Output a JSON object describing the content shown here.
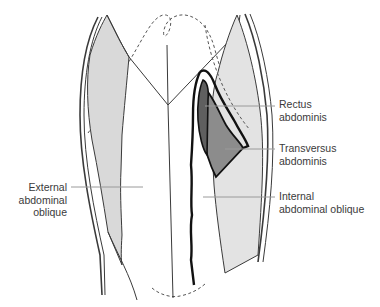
{
  "figure": {
    "type": "anatomical-diagram",
    "colors": {
      "background": "#ffffff",
      "outline": "#3a3a3a",
      "outline_bold": "#111111",
      "external_oblique_fill": "#d9d9d9",
      "internal_oblique_fill": "#e6e6e6",
      "rectus_fill": "#5f5f5f",
      "transversus_fill": "#8c8c8c",
      "leader_line": "#9a9a9a",
      "dashed_outline": "#555555"
    }
  },
  "labels": {
    "rectus": {
      "line1": "Rectus",
      "line2": "abdominis"
    },
    "transversus": {
      "line1": "Transversus",
      "line2": "abdominis"
    },
    "internal_oblique": {
      "line1": "Internal",
      "line2": "abdominal oblique"
    },
    "external_oblique": {
      "line1": "External",
      "line2": "abdominal",
      "line3": "oblique"
    }
  }
}
